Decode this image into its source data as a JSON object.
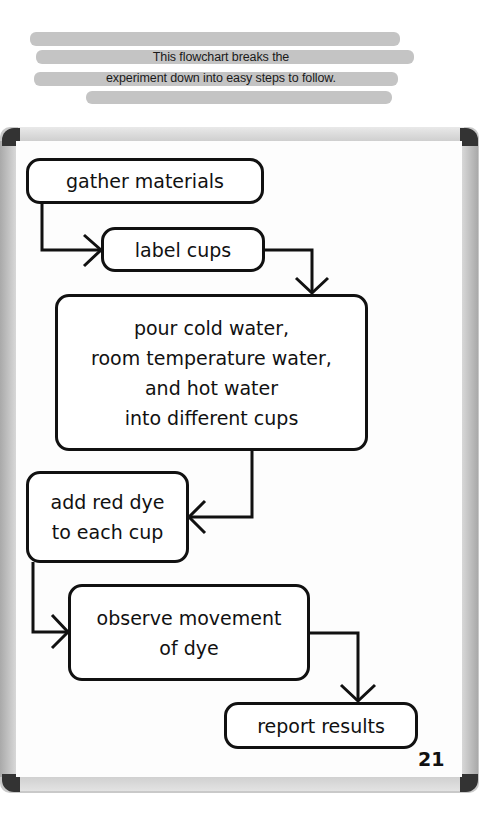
{
  "intro": {
    "line1": "This flowchart breaks the",
    "line2": "experiment down into easy steps to follow."
  },
  "flowchart": {
    "steps": [
      {
        "lines": [
          "gather materials"
        ]
      },
      {
        "lines": [
          "label cups"
        ]
      },
      {
        "lines": [
          "pour cold water,",
          "room temperature water,",
          "and hot water",
          "into different cups"
        ]
      },
      {
        "lines": [
          "add red dye",
          "to each cup"
        ]
      },
      {
        "lines": [
          "observe movement",
          "of dye"
        ]
      },
      {
        "lines": [
          "report results"
        ]
      }
    ]
  },
  "page_number": "21",
  "colors": {
    "highlight": "#c4c4c4",
    "frame": "#c9c9c9",
    "ink": "#111111"
  }
}
